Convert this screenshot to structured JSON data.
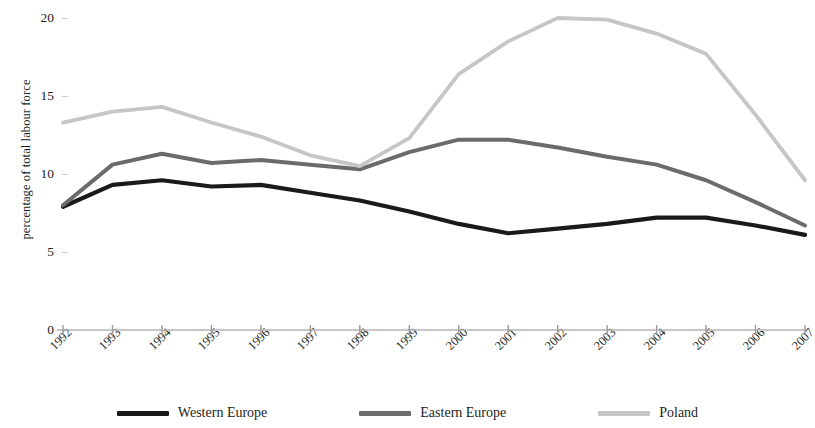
{
  "chart_data": {
    "type": "line",
    "title": "",
    "xlabel": "",
    "ylabel": "percentage of total labour force",
    "categories": [
      "1992",
      "1993",
      "1994",
      "1995",
      "1996",
      "1997",
      "1998",
      "1999",
      "2000",
      "2001",
      "2002",
      "2003",
      "2004",
      "2005",
      "2006",
      "2007"
    ],
    "ylim": [
      0,
      20
    ],
    "yticks": [
      0,
      5,
      10,
      15,
      20
    ],
    "grid": false,
    "legend_position": "bottom",
    "series": [
      {
        "name": "Western Europe",
        "color": "#1a1a1a",
        "values": [
          7.9,
          9.3,
          9.6,
          9.2,
          9.3,
          8.8,
          8.3,
          7.6,
          6.8,
          6.2,
          6.5,
          6.8,
          7.2,
          7.2,
          6.7,
          6.1
        ]
      },
      {
        "name": "Eastern Europe",
        "color": "#6b6b6b",
        "values": [
          8.0,
          10.6,
          11.3,
          10.7,
          10.9,
          10.6,
          10.3,
          11.4,
          12.2,
          12.2,
          11.7,
          11.1,
          10.6,
          9.6,
          8.2,
          6.7
        ]
      },
      {
        "name": "Poland",
        "color": "#c6c6c6",
        "values": [
          13.3,
          14.0,
          14.3,
          13.3,
          12.4,
          11.2,
          10.5,
          12.3,
          16.4,
          18.5,
          20.0,
          19.9,
          19.0,
          17.7,
          13.8,
          9.6
        ]
      }
    ]
  },
  "axes": {
    "y_tick_labels": [
      "20",
      "15",
      "10",
      "5",
      "0"
    ],
    "y_axis_title": "percentage of total labour force"
  },
  "legend": {
    "items": [
      {
        "label": "Western Europe",
        "color": "#1a1a1a"
      },
      {
        "label": "Eastern Europe",
        "color": "#6b6b6b"
      },
      {
        "label": "Poland",
        "color": "#c6c6c6"
      }
    ]
  }
}
